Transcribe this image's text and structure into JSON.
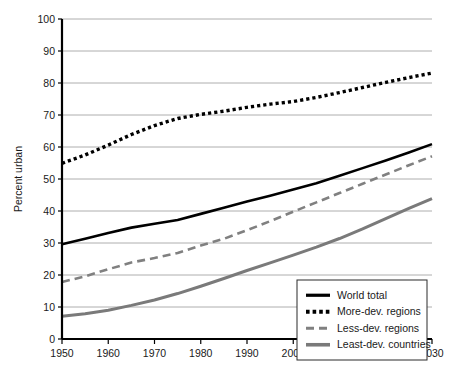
{
  "chart_data": {
    "type": "line",
    "title": "",
    "xlabel": "",
    "ylabel": "Percent urban",
    "xlim": [
      1950,
      2030
    ],
    "ylim": [
      0,
      100
    ],
    "grid": true,
    "legend_position": "bottom-right",
    "x": [
      1950,
      1955,
      1960,
      1965,
      1970,
      1975,
      1980,
      1985,
      1990,
      1995,
      2000,
      2005,
      2010,
      2015,
      2020,
      2025,
      2030
    ],
    "xticks": [
      "1950",
      "1960",
      "1970",
      "1980",
      "1990",
      "2000",
      "2010",
      "2020",
      "2030"
    ],
    "xtick_values": [
      1950,
      1960,
      1970,
      1980,
      1990,
      2000,
      2010,
      2020,
      2030
    ],
    "yticks": [
      "0",
      "10",
      "20",
      "30",
      "40",
      "50",
      "60",
      "70",
      "80",
      "90",
      "100"
    ],
    "ytick_values": [
      0,
      10,
      20,
      30,
      40,
      50,
      60,
      70,
      80,
      90,
      100
    ],
    "series": [
      {
        "name": "World total",
        "style": "solid",
        "color": "#000000",
        "width": 2.6,
        "values": [
          29.6,
          31.3,
          33.1,
          34.8,
          36.0,
          37.2,
          39.1,
          41.0,
          43.0,
          44.8,
          46.7,
          48.7,
          51.0,
          53.4,
          55.8,
          58.3,
          60.9
        ]
      },
      {
        "name": "More-dev. regions",
        "style": "dotted",
        "color": "#000000",
        "width": 3.4,
        "values": [
          54.9,
          57.5,
          60.6,
          63.9,
          66.7,
          68.9,
          70.2,
          71.2,
          72.4,
          73.4,
          74.2,
          75.5,
          77.0,
          78.6,
          80.2,
          81.7,
          83.1
        ]
      },
      {
        "name": "Less-dev. regions",
        "style": "dashed",
        "color": "#808080",
        "width": 2.6,
        "values": [
          17.8,
          19.6,
          21.8,
          23.9,
          25.3,
          26.9,
          29.2,
          31.3,
          34.0,
          36.8,
          39.8,
          42.7,
          45.6,
          48.5,
          51.4,
          54.3,
          57.1
        ]
      },
      {
        "name": "Least-dev. countries",
        "style": "solid",
        "color": "#7a7a7a",
        "width": 3.0,
        "values": [
          7.1,
          7.9,
          9.0,
          10.5,
          12.2,
          14.2,
          16.5,
          18.9,
          21.4,
          23.8,
          26.2,
          28.7,
          31.4,
          34.4,
          37.6,
          40.8,
          43.9
        ]
      }
    ]
  },
  "legend": {
    "items": [
      {
        "label": "World total",
        "marker": "solid-black-line"
      },
      {
        "label": "More-dev. regions",
        "marker": "dotted-black-line"
      },
      {
        "label": "Less-dev. regions",
        "marker": "dashed-gray-line"
      },
      {
        "label": "Least-dev. countries",
        "marker": "solid-gray-line"
      }
    ]
  },
  "colors": {
    "world_total": "#000000",
    "more_dev": "#000000",
    "less_dev": "#808080",
    "least_dev": "#7a7a7a",
    "gridline": "#9a9a9a",
    "axis": "#000000",
    "background": "#ffffff"
  }
}
